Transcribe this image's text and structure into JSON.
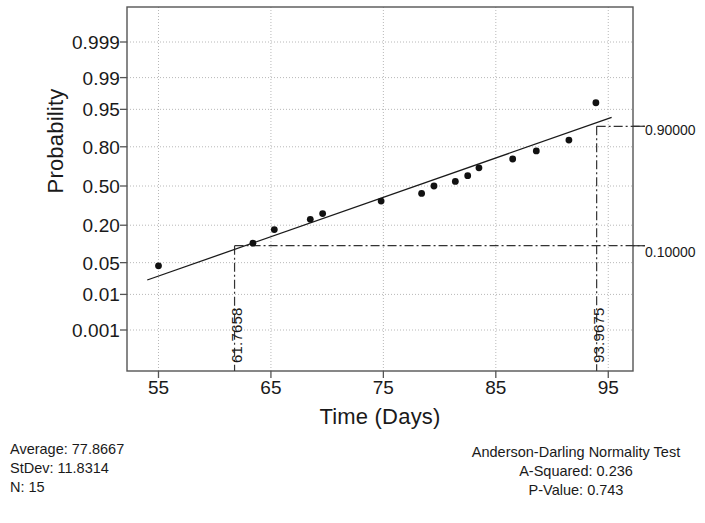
{
  "chart_data": {
    "type": "scatter",
    "title": "",
    "xlabel": "Time (Days)",
    "ylabel": "Probability",
    "xlim": [
      52.2,
      97.2
    ],
    "xticks": [
      55,
      65,
      75,
      85,
      95
    ],
    "yticks": [
      "0.999",
      "0.99",
      "0.95",
      "0.80",
      "0.50",
      "0.20",
      "0.05",
      "0.01",
      "0.001"
    ],
    "ytick_values": [
      0.999,
      0.99,
      0.95,
      0.8,
      0.5,
      0.2,
      0.05,
      0.01,
      0.001
    ],
    "grid": true,
    "legend": false,
    "x": [
      55.0,
      63.4,
      65.3,
      68.5,
      69.6,
      74.8,
      78.4,
      79.5,
      81.4,
      82.5,
      83.5,
      86.5,
      88.6,
      91.5,
      93.9
    ],
    "y": [
      0.0433,
      0.11,
      0.175,
      0.237,
      0.277,
      0.373,
      0.437,
      0.5,
      0.539,
      0.588,
      0.652,
      0.719,
      0.774,
      0.838,
      0.963
    ],
    "series": [
      {
        "name": "Data points",
        "x": [
          55.0,
          63.4,
          65.3,
          68.5,
          69.6,
          74.8,
          78.4,
          79.5,
          81.4,
          82.5,
          83.5,
          86.5,
          88.6,
          91.5,
          93.9
        ],
        "y": [
          0.0433,
          0.11,
          0.175,
          0.237,
          0.277,
          0.373,
          0.437,
          0.5,
          0.539,
          0.588,
          0.652,
          0.719,
          0.774,
          0.838,
          0.963
        ]
      }
    ],
    "fit_line": {
      "name": "Normal fit line",
      "mean": 77.8667,
      "stdev": 11.8314,
      "x_endpoints": [
        54.0,
        95.3
      ]
    },
    "reference_lines": [
      {
        "name": "upper-percentile",
        "probability_label": "0.90000",
        "probability": 0.9,
        "x_value_label": "93.9675",
        "x_value": 93.9675
      },
      {
        "name": "lower-percentile",
        "probability_label": "0.10000",
        "probability": 0.1,
        "x_value_label": "61.7658",
        "x_value": 61.7658
      }
    ]
  },
  "right_labels": {
    "upper": "0.90000",
    "lower": "0.10000"
  },
  "vline_labels": {
    "left": "61.7658",
    "right": "93.9675"
  },
  "footer_left": {
    "average": "Average: 77.8667",
    "stdev": "StDev: 11.8314",
    "n": "N: 15"
  },
  "footer_right": {
    "test_title": "Anderson-Darling Normality Test",
    "a_squared": "A-Squared: 0.236",
    "p_value": "P-Value:   0.743"
  },
  "colors": {
    "foreground": "#1a1a1a",
    "grid": "#b8b8b8",
    "axis": "#555555",
    "marker": "#111111"
  }
}
